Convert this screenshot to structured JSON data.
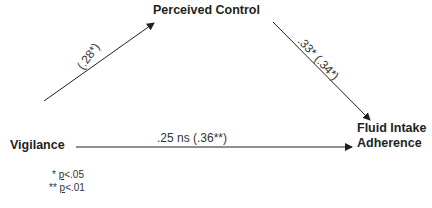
{
  "diagram": {
    "type": "mediation-path-diagram",
    "nodes": {
      "mediator": "Perceived Control",
      "predictor": "Vigilance",
      "outcome_line1": "Fluid Intake",
      "outcome_line2": "Adherence"
    },
    "edges": {
      "a_path": {
        "from": "Vigilance",
        "to": "Perceived Control",
        "label": "(.28*)"
      },
      "b_path": {
        "from": "Perceived Control",
        "to": "Fluid Intake Adherence",
        "label": ".33* (.34*)"
      },
      "c_path": {
        "from": "Vigilance",
        "to": "Fluid Intake Adherence",
        "label": ".25 ns (.36**)"
      }
    },
    "footnotes": {
      "sig05_marker": "* ",
      "sig05_p": "p",
      "sig05_rest": "<.05",
      "sig01_marker": "** ",
      "sig01_p": "p",
      "sig01_rest": "<.01"
    },
    "colors": {
      "line": "#231f20",
      "text": "#231f20"
    }
  }
}
